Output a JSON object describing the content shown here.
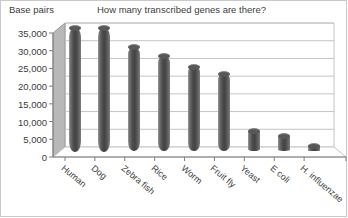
{
  "chart_data": {
    "type": "bar",
    "title": "How many transcribed genes are there?",
    "xlabel": "",
    "ylabel": "Base pairs",
    "categories": [
      "Human",
      "Dog",
      "Zebra fish",
      "Rice",
      "Worm",
      "Fruit fly",
      "Yeast",
      "E coli",
      "H. influenzae"
    ],
    "values": [
      35000,
      35000,
      29500,
      27000,
      24000,
      22000,
      6000,
      4500,
      1700
    ],
    "ylim": [
      0,
      35000
    ],
    "yticks": [
      0,
      5000,
      10000,
      15000,
      20000,
      25000,
      30000,
      35000
    ],
    "ytick_labels": [
      "0",
      "5,000",
      "10,000",
      "15,000",
      "20,000",
      "25,000",
      "30,000",
      "35,000"
    ],
    "grid": true,
    "legend": false,
    "style": "3d-cylinder",
    "bar_color": "#4c4c4c",
    "gridline_color": "#c4c4c4",
    "wall_color": "#b5b5b5",
    "floor_color": "#ffffff",
    "text_color": "#3c3c3c"
  }
}
